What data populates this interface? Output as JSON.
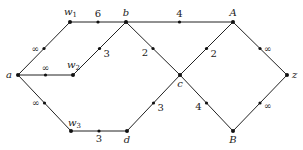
{
  "diagram": {
    "type": "weighted-graph",
    "nodes": [
      {
        "id": "a",
        "label": "a"
      },
      {
        "id": "w1",
        "label": "w",
        "sub": "1"
      },
      {
        "id": "w2",
        "label": "w",
        "sub": "2"
      },
      {
        "id": "w3",
        "label": "w",
        "sub": "3"
      },
      {
        "id": "b",
        "label": "b"
      },
      {
        "id": "c",
        "label": "c"
      },
      {
        "id": "d",
        "label": "d"
      },
      {
        "id": "A",
        "label": "A"
      },
      {
        "id": "B",
        "label": "B"
      },
      {
        "id": "z",
        "label": "z"
      }
    ],
    "edges": [
      {
        "from": "a",
        "to": "w1",
        "weight": "∞"
      },
      {
        "from": "a",
        "to": "w2",
        "weight": "∞"
      },
      {
        "from": "a",
        "to": "w3",
        "weight": "∞"
      },
      {
        "from": "w1",
        "to": "b",
        "weight": "6"
      },
      {
        "from": "w2",
        "to": "b",
        "weight": "3"
      },
      {
        "from": "w3",
        "to": "d",
        "weight": "3"
      },
      {
        "from": "b",
        "to": "A",
        "weight": "4"
      },
      {
        "from": "b",
        "to": "c",
        "weight": "2"
      },
      {
        "from": "c",
        "to": "A",
        "weight": "2"
      },
      {
        "from": "d",
        "to": "c",
        "weight": "3"
      },
      {
        "from": "c",
        "to": "B",
        "weight": "4"
      },
      {
        "from": "A",
        "to": "z",
        "weight": "∞"
      },
      {
        "from": "B",
        "to": "z",
        "weight": "∞"
      }
    ]
  }
}
